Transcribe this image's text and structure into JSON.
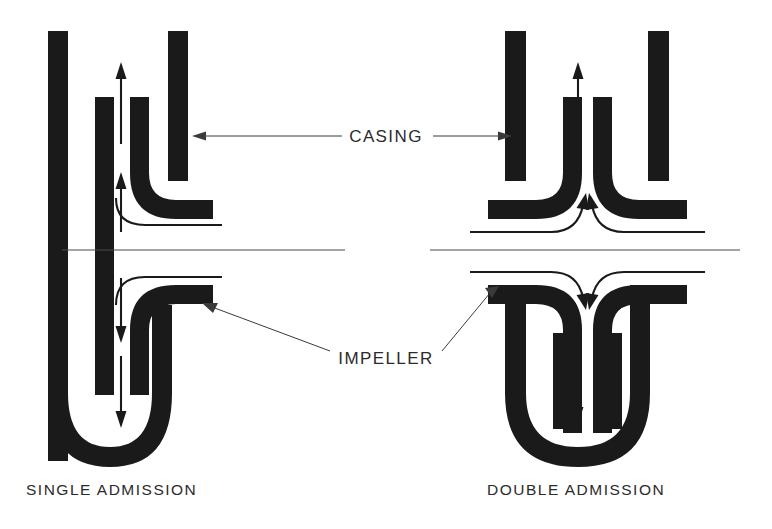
{
  "figure": {
    "background_color": "#ffffff",
    "ink_color": "#1a1a1a",
    "line_color": "#3a3a3a"
  },
  "callouts": {
    "casing": {
      "label": "CASING",
      "x": 386,
      "y": 136,
      "leader_left_target": "left-casing-outer-wall",
      "leader_right_target": "right-casing-outer-wall"
    },
    "impeller": {
      "label": "IMPELLER",
      "x": 386,
      "y": 358,
      "leader_left_target": "left-impeller-hub",
      "leader_right_target": "right-impeller-hub"
    }
  },
  "captions": [
    {
      "label": "SINGLE ADMISSION",
      "x": 26,
      "y": 493,
      "anchor": "start"
    },
    {
      "label": "DOUBLE ADMISSION",
      "x": 487,
      "y": 493,
      "anchor": "start"
    }
  ],
  "diagrams": [
    {
      "name": "single-admission",
      "caption": "SINGLE ADMISSION",
      "admission_sides": 1,
      "centerline_y": 250,
      "centerline_x_start": 60,
      "centerline_x_end": 345,
      "flow_arrows": [
        {
          "name": "discharge-arrow-up-outer",
          "direction": "up",
          "x": 121,
          "from_y": 140,
          "to_y": 70
        },
        {
          "name": "inlet-arrow-up",
          "direction": "up",
          "x": 121,
          "from_y": 230,
          "to_y": 175
        },
        {
          "name": "inlet-arrow-down-upper",
          "direction": "down",
          "x": 121,
          "from_y": 280,
          "to_y": 340
        },
        {
          "name": "inlet-arrow-down-lower",
          "direction": "down",
          "x": 121,
          "from_y": 360,
          "to_y": 425
        }
      ]
    },
    {
      "name": "double-admission",
      "caption": "DOUBLE ADMISSION",
      "admission_sides": 2,
      "centerline_y": 250,
      "centerline_x_start": 430,
      "centerline_x_end": 740,
      "flow_arrows": [
        {
          "name": "discharge-arrow-up-center",
          "direction": "up",
          "x": 578,
          "from_y": 180,
          "to_y": 70
        },
        {
          "name": "outlet-arrow-down-center",
          "direction": "down",
          "x": 578,
          "from_y": 310,
          "to_y": 420
        }
      ]
    }
  ],
  "icon_names": [
    "up-arrow-icon",
    "down-arrow-icon",
    "curved-flow-arrow-icon",
    "leader-line-icon",
    "centerline-icon"
  ]
}
